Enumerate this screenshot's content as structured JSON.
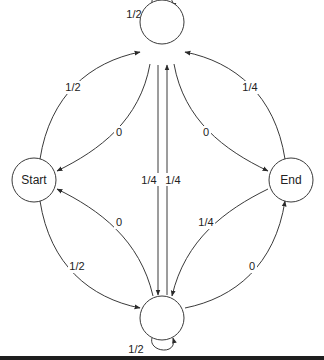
{
  "diagram": {
    "type": "state-transition-graph",
    "nodes": [
      {
        "id": "top",
        "label": ""
      },
      {
        "id": "start",
        "label": "Start"
      },
      {
        "id": "end",
        "label": "End"
      },
      {
        "id": "bottom",
        "label": ""
      }
    ],
    "edges": [
      {
        "id": "top-self",
        "from": "top",
        "to": "top",
        "label": "1/2"
      },
      {
        "id": "start-to-top",
        "from": "start",
        "to": "top",
        "label": "1/2"
      },
      {
        "id": "top-to-start",
        "from": "top",
        "to": "start",
        "label": "0"
      },
      {
        "id": "end-to-top",
        "from": "end",
        "to": "top",
        "label": "1/4"
      },
      {
        "id": "top-to-end",
        "from": "top",
        "to": "end",
        "label": "0"
      },
      {
        "id": "top-to-bottom",
        "from": "top",
        "to": "bottom",
        "label": "1/4"
      },
      {
        "id": "bottom-to-top",
        "from": "bottom",
        "to": "top",
        "label": "1/4"
      },
      {
        "id": "bottom-to-start",
        "from": "bottom",
        "to": "start",
        "label": "0"
      },
      {
        "id": "start-to-bottom",
        "from": "start",
        "to": "bottom",
        "label": "1/2"
      },
      {
        "id": "end-to-bottom",
        "from": "end",
        "to": "bottom",
        "label": "1/4"
      },
      {
        "id": "bottom-to-end",
        "from": "bottom",
        "to": "end",
        "label": "0"
      },
      {
        "id": "bottom-self",
        "from": "bottom",
        "to": "bottom",
        "label": "1/2"
      }
    ]
  }
}
